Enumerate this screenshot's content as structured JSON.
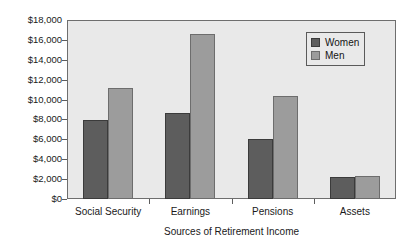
{
  "chart_data": {
    "type": "bar",
    "title": "",
    "xlabel": "Sources of Retirement Income",
    "ylabel": "",
    "categories": [
      "Social Security",
      "Earnings",
      "Pensions",
      "Assets"
    ],
    "series": [
      {
        "name": "Women",
        "color": "#5d5d5d",
        "values": [
          7900,
          8600,
          6000,
          2200
        ]
      },
      {
        "name": "Men",
        "color": "#9c9c9c",
        "values": [
          11200,
          16600,
          10400,
          2300
        ]
      }
    ],
    "ylim": [
      0,
      18000
    ],
    "ytick_values": [
      0,
      2000,
      4000,
      6000,
      8000,
      10000,
      12000,
      14000,
      16000,
      18000
    ],
    "ytick_labels": [
      "$0",
      "$2,000",
      "$4,000",
      "$6,000",
      "$8,000",
      "$10,000",
      "$12,000",
      "$14,000",
      "$16,000",
      "$18,000"
    ],
    "grid": false,
    "legend_position": "upper right",
    "plot_background": "#e9e9e9",
    "figure_background": "#ffffff"
  },
  "legend": {
    "entries": [
      {
        "label": "Women"
      },
      {
        "label": "Men"
      }
    ]
  }
}
